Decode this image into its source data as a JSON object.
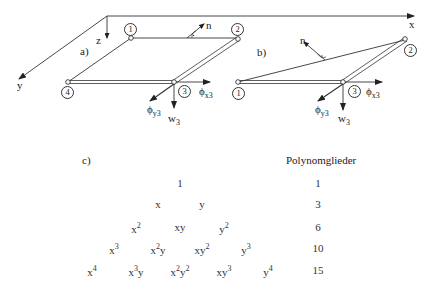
{
  "axes": {
    "x": "x",
    "y": "y",
    "z": "z"
  },
  "figure_a": {
    "label": "a)",
    "normal": "n",
    "nodes": [
      "1",
      "2",
      "3",
      "4"
    ],
    "dof": {
      "phi_x": "ϕ",
      "phi_x_sub": "x3",
      "phi_y": "ϕ",
      "phi_y_sub": "y3",
      "w": "w",
      "w_sub": "3"
    }
  },
  "figure_b": {
    "label": "b)",
    "normal": "n",
    "nodes": [
      "1",
      "2",
      "3"
    ],
    "dof": {
      "phi_x": "ϕ",
      "phi_x_sub": "x3",
      "phi_y": "ϕ",
      "phi_y_sub": "y3",
      "w": "w",
      "w_sub": "3"
    }
  },
  "pascal": {
    "label": "c)",
    "header": "Polynomglieder",
    "rows": [
      {
        "terms": [
          {
            "b": "1",
            "e": ""
          }
        ],
        "count": "1"
      },
      {
        "terms": [
          {
            "b": "x",
            "e": ""
          },
          {
            "b": "y",
            "e": ""
          }
        ],
        "count": "3"
      },
      {
        "terms": [
          {
            "b": "x",
            "e": "2"
          },
          {
            "b": "xy",
            "e": ""
          },
          {
            "b": "y",
            "e": "2"
          }
        ],
        "count": "6"
      },
      {
        "terms": [
          {
            "b": "x",
            "e": "3"
          },
          {
            "b": "x",
            "e": "2",
            "b2": "y"
          },
          {
            "b": "xy",
            "e": "2"
          },
          {
            "b": "y",
            "e": "3"
          }
        ],
        "count": "10"
      },
      {
        "terms": [
          {
            "b": "x",
            "e": "4"
          },
          {
            "b": "x",
            "e": "3",
            "b2": "y"
          },
          {
            "b": "x",
            "e": "2",
            "b2": "y",
            "e2": "2"
          },
          {
            "b": "xy",
            "e": "3"
          },
          {
            "b": "y",
            "e": "4"
          }
        ],
        "count": "15"
      }
    ]
  }
}
